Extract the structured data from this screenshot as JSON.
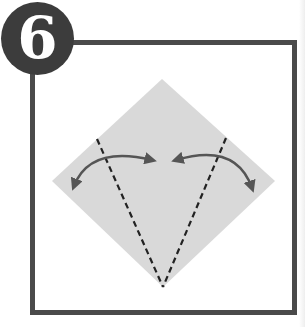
{
  "step": {
    "number": "6"
  },
  "colors": {
    "badge": "#3c3c3c",
    "frame": "#4a4a4a",
    "paper": "#d9d9d9",
    "lines": "#222222",
    "arrows": "#555555"
  },
  "diagram": {
    "shape": "diamond (square rotated 45°)",
    "fold_lines": [
      "left valley fold (dashed)",
      "right valley fold (dashed)"
    ],
    "arrows": [
      "left fold-and-unfold arrow",
      "right fold-and-unfold arrow"
    ]
  }
}
